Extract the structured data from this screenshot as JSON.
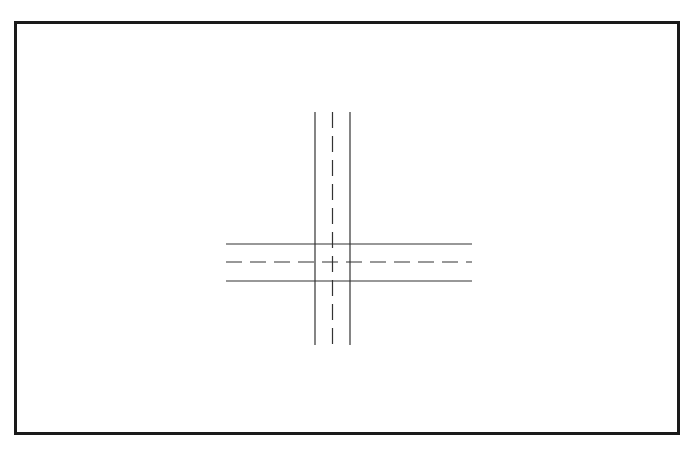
{
  "diagram": {
    "type": "road-intersection-plan",
    "colors": {
      "background": "#ffffff",
      "frame": "#1a1a1a",
      "lines": "#333333"
    },
    "frame": {
      "x": 14,
      "y": 21,
      "width": 666,
      "height": 414,
      "stroke_width": 3
    },
    "vertical_road": {
      "edges_x": [
        315,
        350
      ],
      "centerline_x": 332.5,
      "y_start": 112,
      "y_end": 345,
      "dash_pattern": [
        16,
        8
      ]
    },
    "horizontal_road": {
      "edges_y": [
        244,
        281
      ],
      "centerline_y": 262,
      "x_start": 226,
      "x_end": 472,
      "dash_pattern": [
        16,
        8
      ]
    }
  }
}
